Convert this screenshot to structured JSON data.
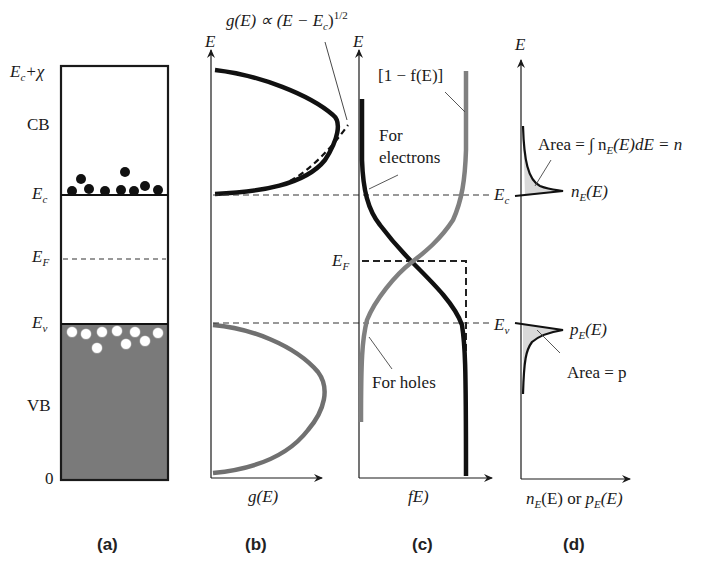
{
  "figure": {
    "panels": [
      {
        "id": "a",
        "caption": "(a)"
      },
      {
        "id": "b",
        "caption": "(b)"
      },
      {
        "id": "c",
        "caption": "(c)"
      },
      {
        "id": "d",
        "caption": "(d)"
      }
    ]
  },
  "panel_a": {
    "top_label_main": "E",
    "top_label_sub": "c",
    "top_label_suffix": "+χ",
    "cb_label": "CB",
    "ec_label_main": "E",
    "ec_label_sub": "c",
    "ef_label_main": "E",
    "ef_label_sub": "F",
    "ev_label_main": "E",
    "ev_label_sub": "v",
    "vb_label": "VB",
    "zero_label": "0",
    "electron_count": 10,
    "hole_count": 10,
    "vb_fill_color": "#7a7a7a"
  },
  "panel_b": {
    "y_axis_label": "E",
    "x_axis_label": "g(E)",
    "annotation": "g(E) ∝ (E − E",
    "annotation_sub": "c",
    "annotation_tail": ")",
    "annotation_sup": "1/2",
    "cb_curve_color": "#111111",
    "vb_curve_color": "#707070"
  },
  "panel_c": {
    "y_axis_label": "E",
    "x_axis_label": "fE)",
    "one_minus_f_label": "[1 − f(E)]",
    "electrons_label_line1": "For",
    "electrons_label_line2": "electrons",
    "holes_label": "For holes",
    "ef_label_main": "E",
    "ef_label_sub": "F",
    "ec_label_main": "E",
    "ec_label_sub": "c",
    "ev_label_main": "E",
    "ev_label_sub": "v"
  },
  "panel_d": {
    "y_axis_label": "E",
    "x_axis_label_n": "n",
    "x_axis_label_sub": "E",
    "x_axis_label_mid": "(E) or ",
    "x_axis_label_p": "p",
    "x_axis_label_tail": "(E)",
    "area_n_label": "Area = ∫ n",
    "area_n_sub": "E",
    "area_n_tail": "(E)dE = n",
    "ne_label": "n",
    "ne_sub": "E",
    "ne_tail": "(E)",
    "pe_label": "p",
    "pe_sub": "E",
    "pe_tail": "(E)",
    "area_p_label": "Area = p",
    "fill_color": "#d9d9d9"
  }
}
